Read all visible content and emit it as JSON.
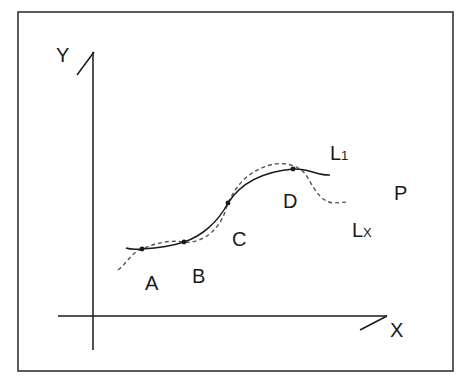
{
  "diagram": {
    "axes": {
      "y_label": "Y",
      "x_label": "X"
    },
    "points": [
      {
        "id": "A",
        "label": "A",
        "x": 142,
        "y": 249
      },
      {
        "id": "B",
        "label": "B",
        "x": 184,
        "y": 242
      },
      {
        "id": "C",
        "label": "C",
        "x": 228,
        "y": 203
      },
      {
        "id": "D",
        "label": "D",
        "x": 293,
        "y": 169
      }
    ],
    "curves": {
      "l1": {
        "label_main": "L",
        "label_sub": "1",
        "style": "solid"
      },
      "lx": {
        "label_main": "L",
        "label_sub": "X",
        "style": "dashed"
      }
    },
    "extra_label": "P",
    "colors": {
      "stroke": "#1a1a1a",
      "dashed": "#555555",
      "frame": "#333333"
    }
  }
}
